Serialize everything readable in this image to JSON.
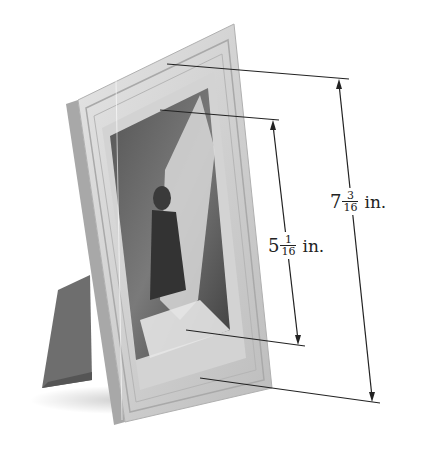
{
  "figure": {
    "colors": {
      "frame": "#c9c9c9",
      "frame_light": "#e2e2e2",
      "frame_dark": "#9a9a9a",
      "mat": "#d4d4d4",
      "photo_dark": "#4a4a4a",
      "stand": "#6e6e6e",
      "dim_line": "#222222"
    }
  },
  "dimensions": {
    "outer": {
      "whole": "7",
      "numerator": "3",
      "denominator": "16",
      "unit": "in."
    },
    "inner": {
      "whole": "5",
      "numerator": "1",
      "denominator": "16",
      "unit": "in."
    }
  }
}
